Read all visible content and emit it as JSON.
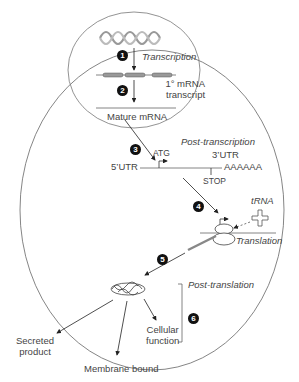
{
  "diagram": {
    "steps": [
      {
        "number": "1",
        "label": "Transcription"
      },
      {
        "number": "2",
        "label": ""
      },
      {
        "number": "3",
        "label": ""
      },
      {
        "number": "4",
        "label": ""
      },
      {
        "number": "5",
        "label": ""
      },
      {
        "number": "6",
        "label": ""
      }
    ],
    "labels": {
      "transcription": "Transcription",
      "primary_transcript_line1": "1° mRNA",
      "primary_transcript_line2": "transcript",
      "mature_mrna": "Mature mRNA",
      "post_transcription": "Post-transcription",
      "atg": "ATG",
      "utr5": "5’UTR",
      "utr3": "3’UTR",
      "polya": "AAAAAA",
      "stop": "STOP",
      "trna": "tRNA",
      "translation": "Translation",
      "post_translation": "Post-translation",
      "cellular_function_line1": "Cellular",
      "cellular_function_line2": "function",
      "secreted_line1": "Secreted",
      "secreted_line2": "product",
      "membrane_bound": "Membrane bound"
    },
    "colors": {
      "line": "#555555",
      "text": "#444444",
      "step_badge": "#111111"
    }
  }
}
